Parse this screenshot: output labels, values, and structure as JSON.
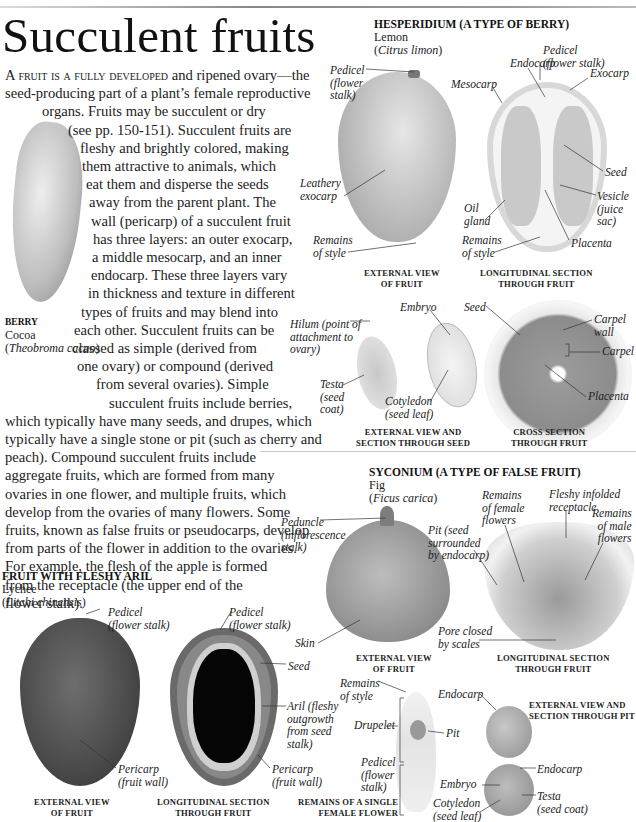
{
  "page": {
    "title": "Succulent fruits",
    "body_lead": "A fruit is a fully developed",
    "body_lines": [
      " and ripened ovary—the",
      "seed-producing part of a plant’s female reproductive",
      "organs. Fruits may be succulent or dry",
      "(see pp. 150-151). Succulent fruits are",
      "fleshy and brightly colored, making",
      "them attractive to animals, which",
      "eat them and disperse the seeds",
      "away from the parent plant. The",
      "wall (pericarp) of a succulent fruit",
      "has three layers: an outer exocarp,",
      "a middle mesocarp, and an inner",
      "endocarp. These three layers vary",
      "in thickness and texture in different",
      "types of fruits and may blend into",
      "each other. Succulent fruits can be",
      "classed as simple (derived from",
      "one ovary) or compound (derived",
      "from several ovaries). Simple",
      "succulent fruits include berries,",
      "which typically have many seeds, and drupes, which",
      "typically have a single stone or pit (such as cherry and",
      "peach). Compound succulent fruits include",
      "aggregate fruits, which are formed from many",
      "ovaries in one flower, and multiple fruits, which",
      "develop from the ovaries of many flowers. Some",
      "fruits, known as false fruits or pseudocarps, develop",
      "from parts of the flower in addition to the ovaries.",
      "For example, the flesh of the apple is formed",
      "from the receptacle (the upper end of the",
      "flower stalk)."
    ]
  },
  "berry": {
    "heading": "BERRY",
    "common": "Cocoa",
    "latin": "Theobroma cacao"
  },
  "hesperidium": {
    "heading": "HESPERIDIUM (A TYPE OF BERRY)",
    "common": "Lemon",
    "latin": "Citrus limon",
    "labels": {
      "pedicel_ext": [
        "Pedicel",
        "(flower",
        "stalk)"
      ],
      "leathery": [
        "Leathery",
        "exocarp"
      ],
      "style_ext": [
        "Remains",
        "of style"
      ],
      "endocarp": "Endocarp",
      "pedicel_sec": [
        "Pedicel",
        "(flower stalk)"
      ],
      "mesocarp": "Mesocarp",
      "exocarp": "Exocarp",
      "seed": "Seed",
      "vesicle": [
        "Vesicle",
        "(juice",
        "sac)"
      ],
      "oil_gland": [
        "Oil",
        "gland"
      ],
      "style_sec": [
        "Remains",
        "of style"
      ],
      "placenta": "Placenta",
      "hilum": [
        "Hilum (point of",
        "attachment to",
        "ovary)"
      ],
      "embryo": "Embryo",
      "testa": [
        "Testa",
        "(seed",
        "coat)"
      ],
      "cotyledon": [
        "Cotyledon",
        "(seed leaf)"
      ],
      "seed_cross": "Seed",
      "carpel_wall": [
        "Carpel",
        "wall"
      ],
      "carpel": "Carpel",
      "placenta_cross": "Placenta"
    },
    "captions": {
      "external": [
        "EXTERNAL VIEW",
        "OF FRUIT"
      ],
      "longitudinal": [
        "LONGITUDINAL SECTION",
        "THROUGH FRUIT"
      ],
      "seed": [
        "EXTERNAL VIEW AND",
        "SECTION THROUGH SEED"
      ],
      "cross": [
        "CROSS SECTION",
        "THROUGH FRUIT"
      ]
    }
  },
  "syconium": {
    "heading": "SYCONIUM (A TYPE OF FALSE FRUIT)",
    "common": "Fig",
    "latin": "Ficus carica",
    "labels": {
      "peduncle": [
        "Peduncle",
        "(inflorescence",
        "stalk)"
      ],
      "skin": "Skin",
      "female": [
        "Remains",
        "of female",
        "flowers"
      ],
      "receptacle": [
        "Fleshy infolded",
        "receptacle"
      ],
      "male": [
        "Remains",
        "of male",
        "flowers"
      ],
      "pit": [
        "Pit (seed",
        "surrounded",
        "by endocarp)"
      ],
      "pore": [
        "Pore closed",
        "by scales"
      ]
    },
    "captions": {
      "external": [
        "EXTERNAL VIEW",
        "OF FRUIT"
      ],
      "longitudinal": [
        "LONGITUDINAL SECTION",
        "THROUGH FRUIT"
      ]
    }
  },
  "aril": {
    "heading": "FRUIT WITH FLESHY ARIL",
    "common": "Lychee",
    "latin": "Litchi chinensis",
    "labels": {
      "pedicel_ext": [
        "Pedicel",
        "(flower stalk)"
      ],
      "pedicel_sec": [
        "Pedicel",
        "(flower stalk)"
      ],
      "seed": "Seed",
      "aril": [
        "Aril (fleshy",
        "outgrowth",
        "from seed",
        "stalk)"
      ],
      "pericarp_ext": [
        "Pericarp",
        "(fruit wall)"
      ],
      "pericarp_sec": [
        "Pericarp",
        "(fruit wall)"
      ]
    },
    "captions": {
      "external": [
        "EXTERNAL VIEW",
        "OF FRUIT"
      ],
      "longitudinal": [
        "LONGITUDINAL SECTION",
        "THROUGH  FRUIT"
      ]
    }
  },
  "drupelet": {
    "labels": {
      "style": [
        "Remains",
        "of style"
      ],
      "drupelet": "Drupelet",
      "pit": "Pit",
      "pedicel": [
        "Pedicel",
        "(flower",
        "stalk)"
      ],
      "endocarp_top": "Endocarp",
      "endocarp_bot": "Endocarp",
      "embryo": "Embryo",
      "testa": [
        "Testa",
        "(seed coat)"
      ],
      "cotyledon": [
        "Cotyledon",
        "(seed leaf)"
      ]
    },
    "captions": {
      "single_flower": [
        "REMAINS OF A SINGLE",
        "FEMALE FLOWER"
      ],
      "pit": [
        "EXTERNAL VIEW AND",
        "SECTION THROUGH PIT"
      ]
    }
  }
}
